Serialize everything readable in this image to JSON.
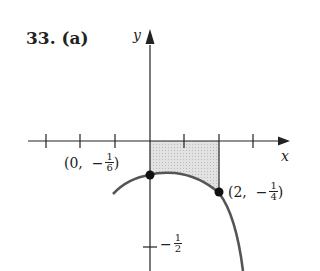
{
  "problem": {
    "number": "33.",
    "part": "(a)",
    "title": "33.  (a)"
  },
  "axes": {
    "x_label": "x",
    "y_label": "y"
  },
  "points": [
    {
      "open": "(0,",
      "sign": "−",
      "num": "1",
      "den": "6",
      "close": ")"
    },
    {
      "open": "(2,",
      "sign": "−",
      "num": "1",
      "den": "4",
      "close": ")"
    }
  ],
  "y_tick": {
    "sign": "−",
    "num": "1",
    "den": "2"
  },
  "colors": {
    "curve": "#555555",
    "shade": "#d4d4d4",
    "axis": "#222222"
  }
}
